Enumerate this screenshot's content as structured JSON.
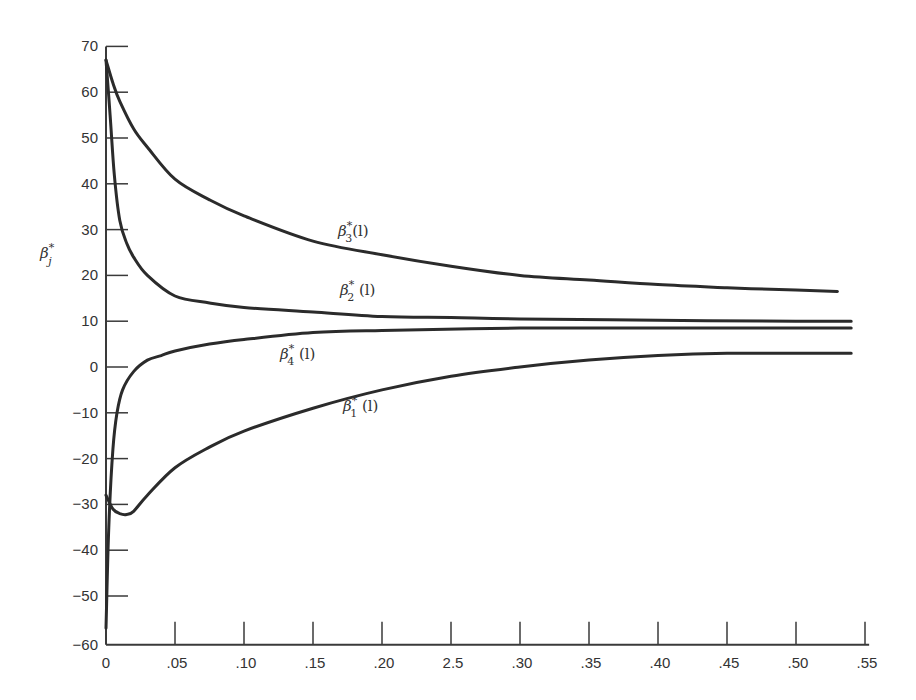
{
  "chart_data": {
    "type": "line",
    "title": "",
    "xlabel": "",
    "ylabel": "β*_j",
    "xlim": [
      0,
      0.55
    ],
    "ylim": [
      -60,
      70
    ],
    "grid": false,
    "legend": "inline curve labels",
    "x_ticks": [
      "0",
      ".05",
      ".10",
      ".15",
      ".20",
      "2.5",
      ".30",
      ".35",
      ".40",
      ".45",
      ".50",
      ".55"
    ],
    "y_ticks": [
      "70",
      "60",
      "50",
      "40",
      "30",
      "20",
      "10",
      "0",
      "−10",
      "−20",
      "−30",
      "−40",
      "−50",
      "−60"
    ],
    "series": [
      {
        "name": "β*_3(l)",
        "x": [
          0,
          0.005,
          0.01,
          0.02,
          0.03,
          0.05,
          0.075,
          0.1,
          0.15,
          0.2,
          0.25,
          0.3,
          0.35,
          0.4,
          0.45,
          0.5,
          0.53
        ],
        "y": [
          67,
          62,
          58,
          52,
          48,
          41,
          36.5,
          33,
          27.5,
          24.5,
          22,
          20,
          19,
          18,
          17.3,
          16.8,
          16.5
        ]
      },
      {
        "name": "β*_2(l)",
        "x": [
          0,
          0.003,
          0.006,
          0.01,
          0.015,
          0.02,
          0.03,
          0.05,
          0.075,
          0.1,
          0.15,
          0.2,
          0.25,
          0.3,
          0.4,
          0.5,
          0.54
        ],
        "y": [
          67,
          55,
          42,
          32,
          27,
          24,
          20,
          15.5,
          14,
          13,
          12,
          11,
          10.8,
          10.5,
          10.2,
          10,
          10
        ]
      },
      {
        "name": "β*_4(l)",
        "x": [
          0,
          0.002,
          0.005,
          0.008,
          0.012,
          0.02,
          0.03,
          0.04,
          0.05,
          0.075,
          0.1,
          0.15,
          0.2,
          0.3,
          0.4,
          0.54
        ],
        "y": [
          -57,
          -35,
          -18,
          -10,
          -5,
          -1,
          1.5,
          2.5,
          3.5,
          5,
          6,
          7.5,
          8,
          8.5,
          8.5,
          8.5
        ]
      },
      {
        "name": "β*_1(l)",
        "x": [
          0,
          0.005,
          0.01,
          0.015,
          0.02,
          0.03,
          0.05,
          0.075,
          0.1,
          0.15,
          0.2,
          0.25,
          0.3,
          0.35,
          0.4,
          0.45,
          0.5,
          0.54
        ],
        "y": [
          -28,
          -31,
          -32,
          -32.2,
          -31.5,
          -28,
          -22,
          -17.5,
          -14,
          -9,
          -5,
          -2,
          0,
          1.5,
          2.5,
          3,
          3,
          3
        ]
      }
    ],
    "annotations": [
      {
        "text": "β*_3(l)",
        "x": 0.18,
        "y": 30
      },
      {
        "text": "β*_2 (l)",
        "x": 0.18,
        "y": 16
      },
      {
        "text": "β*_4 (l)",
        "x": 0.13,
        "y": 2
      },
      {
        "text": "β*_1 (l)",
        "x": 0.18,
        "y": -15
      }
    ]
  },
  "labels": {
    "y_axis": {
      "base": "β",
      "sup": "*",
      "sub": "j"
    },
    "curves": [
      {
        "base": "β",
        "sup": "*",
        "sub": "3",
        "suffix": "(l)"
      },
      {
        "base": "β",
        "sup": "*",
        "sub": "2",
        "suffix": " (l)"
      },
      {
        "base": "β",
        "sup": "*",
        "sub": "4",
        "suffix": " (l)"
      },
      {
        "base": "β",
        "sup": "*",
        "sub": "1",
        "suffix": " (l)"
      }
    ]
  },
  "style": {
    "line_color": "#2b2b2b",
    "axis_color": "#3a3a3a",
    "background": "#ffffff"
  }
}
